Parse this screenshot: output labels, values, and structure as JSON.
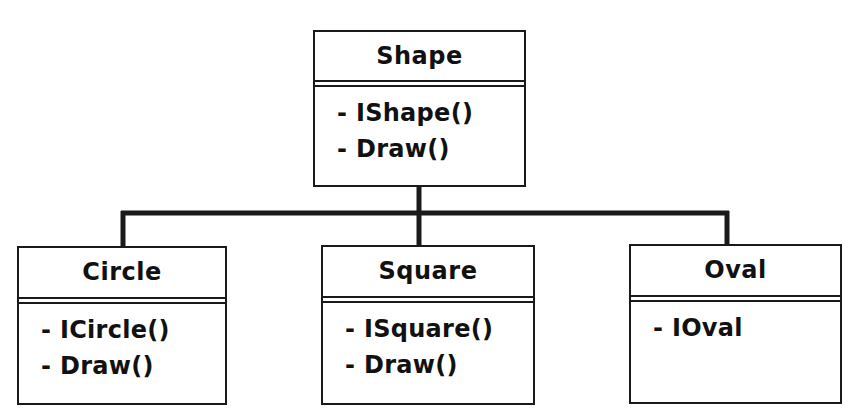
{
  "diagram": {
    "type": "uml-class-hierarchy",
    "parent": {
      "name": "Shape",
      "members": [
        "- IShape()",
        "- Draw()"
      ]
    },
    "children": [
      {
        "name": "Circle",
        "members": [
          "- ICircle()",
          "- Draw()"
        ]
      },
      {
        "name": "Square",
        "members": [
          "- ISquare()",
          "- Draw()"
        ]
      },
      {
        "name": "Oval",
        "members": [
          "- IOval"
        ]
      }
    ],
    "colors": {
      "line": "#1a1a1a",
      "background": "#ffffff"
    }
  }
}
